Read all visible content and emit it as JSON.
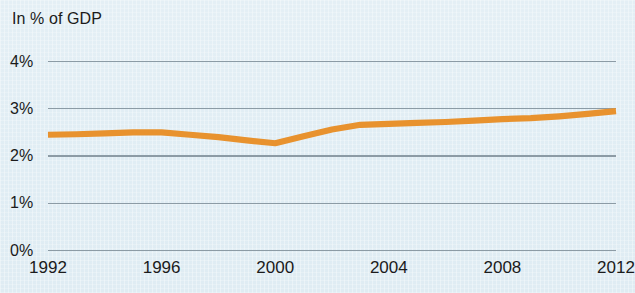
{
  "chart_data": {
    "type": "line",
    "title": "In % of GDP",
    "xlabel": "",
    "ylabel": "In % of GDP",
    "xlim": [
      1992,
      2012
    ],
    "ylim": [
      0,
      4
    ],
    "grid": true,
    "legend": false,
    "line_color": "#e8922e",
    "background_color": "#e2eef4",
    "gridline_color": "#8c9ba5",
    "y_ticks": [
      "0%",
      "1%",
      "2%",
      "3%",
      "4%"
    ],
    "y_tick_values": [
      0,
      1,
      2,
      3,
      4
    ],
    "x_ticks": [
      "1992",
      "1996",
      "2000",
      "2004",
      "2008",
      "2012"
    ],
    "x_tick_values": [
      1992,
      1996,
      2000,
      2004,
      2008,
      2012
    ],
    "x": [
      1992,
      1993,
      1994,
      1995,
      1996,
      1997,
      1998,
      1999,
      2000,
      2001,
      2002,
      2003,
      2004,
      2005,
      2006,
      2007,
      2008,
      2009,
      2010,
      2011,
      2012
    ],
    "values": [
      2.45,
      2.46,
      2.48,
      2.5,
      2.5,
      2.45,
      2.4,
      2.33,
      2.27,
      2.42,
      2.56,
      2.66,
      2.68,
      2.7,
      2.72,
      2.75,
      2.78,
      2.8,
      2.84,
      2.89,
      2.95
    ],
    "series": [
      {
        "name": "In % of GDP",
        "values": [
          2.45,
          2.46,
          2.48,
          2.5,
          2.5,
          2.45,
          2.4,
          2.33,
          2.27,
          2.42,
          2.56,
          2.66,
          2.68,
          2.7,
          2.72,
          2.75,
          2.78,
          2.8,
          2.84,
          2.89,
          2.95
        ]
      }
    ]
  }
}
